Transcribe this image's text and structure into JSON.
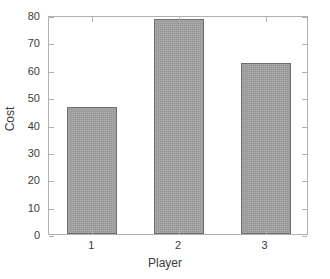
{
  "chart_data": {
    "type": "bar",
    "title": "",
    "xlabel": "Player",
    "ylabel": "Cost",
    "categories": [
      "1",
      "2",
      "3"
    ],
    "values": [
      46.3,
      78.5,
      62.3
    ],
    "series": [
      {
        "name": "Cost",
        "values": [
          46.3,
          78.5,
          62.3
        ]
      }
    ],
    "ylim": [
      0,
      80
    ],
    "ytick_labels": [
      "0",
      "10",
      "20",
      "30",
      "40",
      "50",
      "60",
      "70",
      "80"
    ],
    "ytick_values": [
      0,
      10,
      20,
      30,
      40,
      50,
      60,
      70,
      80
    ],
    "xtick_labels": [
      "1",
      "2",
      "3"
    ],
    "grid": false,
    "legend": null,
    "bar_fill_color": "#a2a2a2",
    "bar_edge_color": "#6e6e6e",
    "axis_color": "#b0b0b0",
    "text_color": "#3c3c3c",
    "background_color": "#ffffff"
  },
  "figure": {
    "ylabel_text": "Cost",
    "xlabel_text": "Player"
  }
}
